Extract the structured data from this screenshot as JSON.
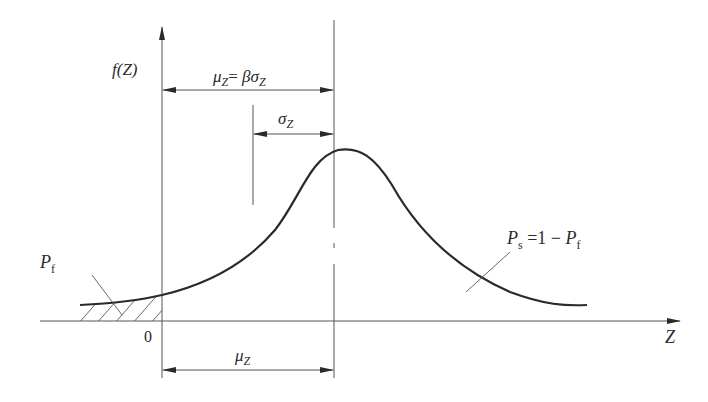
{
  "diagram": {
    "y_axis_label": "f(Z)",
    "x_axis_label": "Z",
    "origin_label": "0",
    "labels": {
      "mean_beta_sigma": {
        "mu": "μ",
        "mu_sub": "Z",
        "eq": "= ",
        "beta": "β",
        "sigma": "σ",
        "sigma_sub": "Z"
      },
      "sigma": {
        "sigma": "σ",
        "sub": "Z"
      },
      "mean": {
        "mu": "μ",
        "sub": "Z"
      },
      "failure_prob": {
        "p": "P",
        "sub": "f"
      },
      "survival_prob": {
        "p": "P",
        "sub": "s",
        "eq": " =1 − ",
        "p2": "P",
        "sub2": "f"
      }
    },
    "colors": {
      "line": "#2a2a2a",
      "thin": "#555555",
      "background": "#ffffff"
    }
  }
}
